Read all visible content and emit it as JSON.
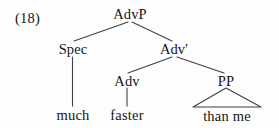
{
  "figure": {
    "example_number": "(18)",
    "background_color": "#fdfdfd",
    "line_color": "#404040",
    "text_color": "#151515",
    "width": 279,
    "height": 128
  },
  "tree": {
    "type": "syntax-tree",
    "root": "AdvP",
    "nodes": [
      {
        "id": "advp",
        "label": "AdvP",
        "kind": "phrase",
        "x": 130,
        "y": 14
      },
      {
        "id": "spec",
        "label": "Spec",
        "kind": "specifier",
        "x": 73,
        "y": 49
      },
      {
        "id": "advbar",
        "label": "Adv′",
        "kind": "bar-level",
        "x": 174,
        "y": 49
      },
      {
        "id": "adv",
        "label": "Adv",
        "kind": "head",
        "x": 127,
        "y": 81
      },
      {
        "id": "pp",
        "label": "PP",
        "kind": "phrase",
        "x": 226,
        "y": 81
      },
      {
        "id": "much",
        "label": "much",
        "kind": "terminal",
        "x": 73,
        "y": 115
      },
      {
        "id": "faster",
        "label": "faster",
        "kind": "terminal",
        "x": 127,
        "y": 115
      },
      {
        "id": "thanme",
        "label": "than  me",
        "kind": "terminal",
        "x": 227,
        "y": 116
      }
    ],
    "edges": [
      {
        "from": "advp",
        "to": "spec",
        "style": "line"
      },
      {
        "from": "advp",
        "to": "advbar",
        "style": "line"
      },
      {
        "from": "advbar",
        "to": "adv",
        "style": "line"
      },
      {
        "from": "advbar",
        "to": "pp",
        "style": "line"
      },
      {
        "from": "spec",
        "to": "much",
        "style": "line"
      },
      {
        "from": "adv",
        "to": "faster",
        "style": "line"
      },
      {
        "from": "pp",
        "to": "thanme",
        "style": "triangle"
      }
    ],
    "sentence": "much faster than me"
  }
}
